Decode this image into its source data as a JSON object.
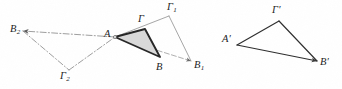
{
  "figure": {
    "caption": "",
    "width": 342,
    "height": 89,
    "background_color": "#ffffff",
    "shaded_fill_color": "#d9d9d9",
    "stroke_color": "#262626",
    "faint_stroke_color": "#8a8a8a",
    "label_color": "#222222"
  },
  "left_figure": {
    "name": "triangle-family-around-A",
    "shared_vertex": "A",
    "labels": {
      "a": {
        "text": "A",
        "sub": "",
        "prime": "",
        "x": 104,
        "y": 29
      },
      "gamma": {
        "text": "Γ",
        "sub": "",
        "prime": "",
        "x": 138,
        "y": 14
      },
      "b": {
        "text": "B",
        "sub": "",
        "prime": "",
        "x": 156,
        "y": 62
      },
      "gamma1": {
        "text": "Γ",
        "sub": "1",
        "prime": "",
        "x": 167,
        "y": 2
      },
      "b1": {
        "text": "B",
        "sub": "1",
        "prime": "",
        "x": 194,
        "y": 60
      },
      "b2": {
        "text": "B",
        "sub": "2",
        "prime": "",
        "x": 10,
        "y": 24
      },
      "gamma2": {
        "text": "Γ",
        "sub": "2",
        "prime": "",
        "x": 60,
        "y": 71
      }
    },
    "points": {
      "A": [
        115,
        37
      ],
      "Gamma": [
        145,
        29
      ],
      "B": [
        160,
        57
      ],
      "Gamma1": [
        169,
        16
      ],
      "B1": [
        191,
        61
      ],
      "B2": [
        23,
        31
      ],
      "Gamma2": [
        69,
        70
      ]
    },
    "triangles": [
      {
        "name": "shaded-triangle-AGammaB",
        "vertices": [
          "A",
          "Gamma",
          "B"
        ],
        "style": "solid-thick-shaded"
      },
      {
        "name": "outline-triangle-AGamma1B1",
        "vertices": [
          "A",
          "Gamma1",
          "B1"
        ],
        "style": "thin-solid"
      },
      {
        "name": "dashdot-triangle-AB2Gamma2",
        "vertices": [
          "A",
          "B2",
          "Gamma2"
        ],
        "style": "dash-dot"
      }
    ]
  },
  "right_figure": {
    "name": "image-triangle-primed",
    "labels": {
      "a_prime": {
        "text": "A",
        "sub": "",
        "prime": "′",
        "x": 222,
        "y": 34
      },
      "gamma_prime": {
        "text": "Γ",
        "sub": "",
        "prime": "′",
        "x": 272,
        "y": 5
      },
      "b_prime": {
        "text": "B",
        "sub": "",
        "prime": "′",
        "x": 320,
        "y": 57
      }
    },
    "points": {
      "A_prime": [
        237,
        45
      ],
      "Gamma_prime": [
        279,
        21
      ],
      "B_prime": [
        317,
        61
      ]
    },
    "triangles": [
      {
        "name": "outline-triangle-primed",
        "vertices": [
          "A_prime",
          "Gamma_prime",
          "B_prime"
        ],
        "style": "thin-solid"
      }
    ]
  }
}
